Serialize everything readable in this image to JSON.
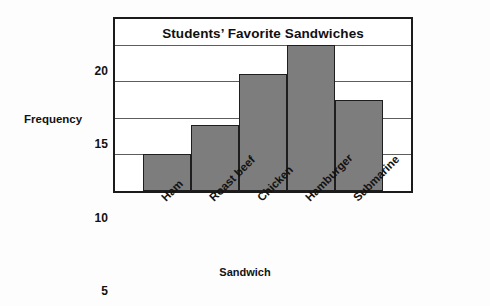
{
  "chart_data": {
    "type": "bar",
    "title": "Students’ Favorite Sandwiches",
    "xlabel": "Sandwich",
    "ylabel": "Frequency",
    "categories": [
      "Ham",
      "Roast beef",
      "Chicken",
      "Hamburger",
      "Submarine"
    ],
    "values": [
      5,
      9,
      16,
      20,
      12.5
    ],
    "ylim": [
      0,
      23.5
    ],
    "yticks": [
      0,
      5,
      10,
      15,
      20
    ],
    "ytick_labels": [
      "0",
      "5",
      "10",
      "15",
      "20"
    ],
    "grid": true,
    "legend": "none",
    "bar_color": "#7d7d7d",
    "bar_edge_color": "#1e1e1e",
    "frame_color": "#1b1b1b",
    "gridline_color": "#5d5d5d",
    "plot_background": "#ffffff",
    "figure_background": "#fdfdfd",
    "xtick_rotation": "-45",
    "bars_start_fraction": 0.095,
    "bars_end_fraction": 0.905
  }
}
